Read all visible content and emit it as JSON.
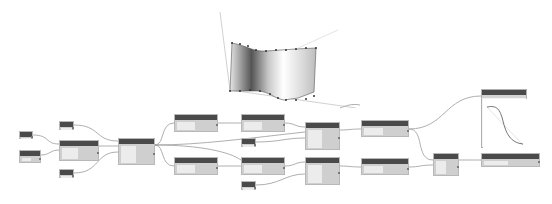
{
  "canvas": {
    "background": "#ffffff",
    "header_color": "#4a4a4a",
    "node_color": "#cfcfcf",
    "wire_color": "#9a9a9a"
  },
  "nodes": [
    {
      "id": "n1",
      "x": 19,
      "y": 131,
      "w": 14,
      "h": 8,
      "label": "Number"
    },
    {
      "id": "n2",
      "x": 19,
      "y": 150,
      "w": 22,
      "h": 13,
      "label": "Number"
    },
    {
      "id": "n3",
      "x": 59,
      "y": 121,
      "w": 15,
      "h": 9,
      "label": "Number"
    },
    {
      "id": "n4",
      "x": 59,
      "y": 140,
      "w": 40,
      "h": 21,
      "label": "Node"
    },
    {
      "id": "n5",
      "x": 59,
      "y": 169,
      "w": 15,
      "h": 9,
      "label": "Number"
    },
    {
      "id": "n6",
      "x": 118,
      "y": 138,
      "w": 37,
      "h": 27,
      "label": "Node"
    },
    {
      "id": "n7",
      "x": 174,
      "y": 114,
      "w": 44,
      "h": 18,
      "label": "Node"
    },
    {
      "id": "n8",
      "x": 174,
      "y": 157,
      "w": 44,
      "h": 18,
      "label": "Node"
    },
    {
      "id": "n9",
      "x": 241,
      "y": 114,
      "w": 44,
      "h": 18,
      "label": "Node"
    },
    {
      "id": "n10",
      "x": 241,
      "y": 157,
      "w": 44,
      "h": 18,
      "label": "Node"
    },
    {
      "id": "n11",
      "x": 241,
      "y": 138,
      "w": 15,
      "h": 9,
      "label": "Number"
    },
    {
      "id": "n12",
      "x": 241,
      "y": 181,
      "w": 15,
      "h": 9,
      "label": "Number"
    },
    {
      "id": "n13",
      "x": 305,
      "y": 122,
      "w": 35,
      "h": 28,
      "label": "Node"
    },
    {
      "id": "n14",
      "x": 305,
      "y": 157,
      "w": 35,
      "h": 28,
      "label": "Node"
    },
    {
      "id": "n15",
      "x": 361,
      "y": 120,
      "w": 48,
      "h": 17,
      "label": "Node"
    },
    {
      "id": "n16",
      "x": 361,
      "y": 158,
      "w": 48,
      "h": 17,
      "label": "Node"
    },
    {
      "id": "n17",
      "x": 433,
      "y": 153,
      "w": 26,
      "h": 23,
      "label": "Node"
    },
    {
      "id": "n18",
      "x": 481,
      "y": 153,
      "w": 59,
      "h": 14,
      "label": "Node"
    }
  ],
  "watch_preview": {
    "x": 481,
    "y": 89,
    "w": 46,
    "h": 59,
    "label": "Watch"
  },
  "viewport": {
    "label": "3D surface preview"
  }
}
